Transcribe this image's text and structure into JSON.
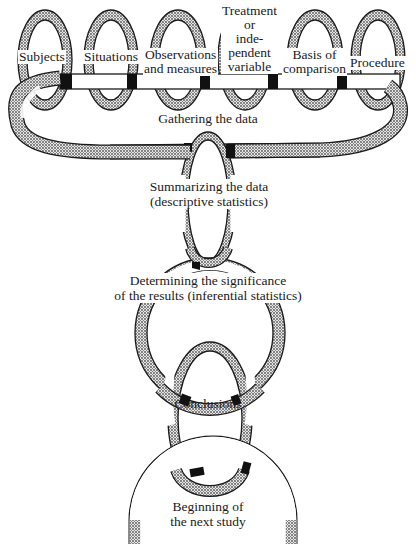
{
  "diagram": {
    "type": "chain-of-rings",
    "top_rings": [
      {
        "label": "Subjects"
      },
      {
        "label": "Situations"
      },
      {
        "label": "Observations and measures",
        "lines": [
          "Observations",
          "and measures"
        ]
      },
      {
        "label": "Treatment or independent variable",
        "lines": [
          "Treatment",
          "or",
          "inde-",
          "pendent",
          "variable"
        ]
      },
      {
        "label": "Basis of comparison",
        "lines": [
          "Basis of",
          "comparison"
        ]
      },
      {
        "label": "Procedure"
      }
    ],
    "chain": [
      {
        "label": "Gathering the data",
        "lines": [
          "Gathering the data"
        ]
      },
      {
        "label": "Summarizing the data (descriptive statistics)",
        "lines": [
          "Summarizing the data",
          "(descriptive statistics)"
        ]
      },
      {
        "label": "Determining the significance of the results (inferential statistics)",
        "lines": [
          "Determining the significance",
          "of the results (inferential statistics)"
        ]
      },
      {
        "label": "Conclusions",
        "lines": [
          "Conclusions"
        ]
      },
      {
        "label": "Beginning of the next study",
        "lines": [
          "Beginning of",
          "the next study"
        ]
      }
    ],
    "colors": {
      "ink": "#1a1a1a",
      "shade": "#a8a8a8",
      "paper": "#ffffff"
    }
  }
}
